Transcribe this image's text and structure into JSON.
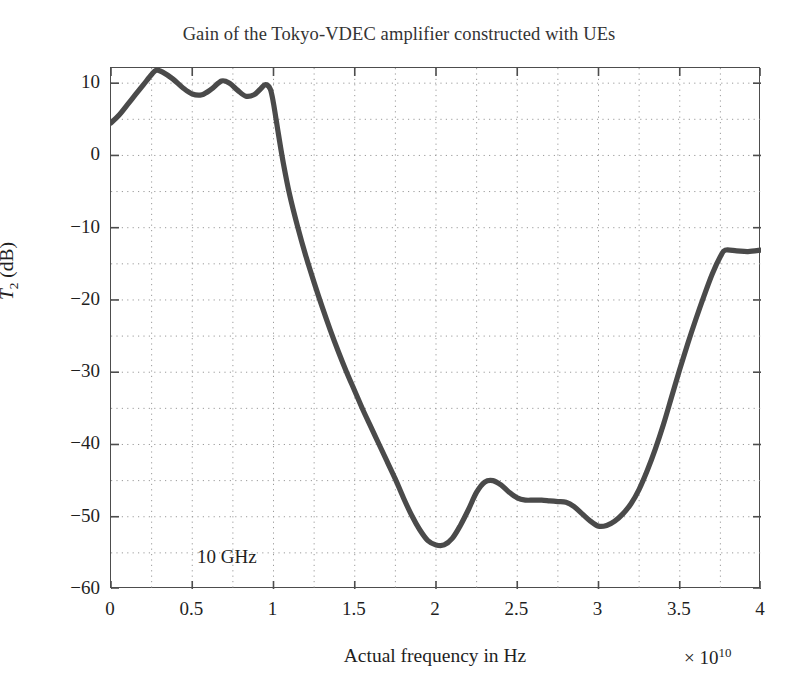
{
  "chart_data": {
    "type": "line",
    "title": "Gain of the Tokyo-VDEC amplifier constructed with UEs",
    "xlabel": "Actual frequency in Hz",
    "ylabel": "T_2 (dB)",
    "ylabel_base": "T",
    "ylabel_sub": "2",
    "ylabel_unit": " (dB)",
    "x_exponent_prefix": "× 10",
    "x_exponent_power": "10",
    "x_multiplier": 10000000000.0,
    "xlim": [
      0,
      4
    ],
    "ylim": [
      -60,
      12.1
    ],
    "xticks": [
      0,
      0.5,
      1,
      1.5,
      2,
      2.5,
      3,
      3.5,
      4
    ],
    "xtick_labels": [
      "0",
      "0.5",
      "1",
      "1.5",
      "2",
      "2.5",
      "3",
      "3.5",
      "4"
    ],
    "yticks": [
      10,
      0,
      -10,
      -20,
      -30,
      -40,
      -50,
      -60
    ],
    "ytick_labels": [
      "10",
      "0",
      "−10",
      "−20",
      "−30",
      "−40",
      "−50",
      "−60"
    ],
    "grid": true,
    "grid_style": "dotted",
    "grid_x_minor_step": 0.25,
    "grid_y_minor_step": 5,
    "legend": null,
    "annotations": [
      {
        "text": "10 GHz",
        "x": 0.53,
        "y": -55.0
      }
    ],
    "line_color": "#4a4a4a",
    "line_width": 5.2,
    "series": [
      {
        "name": "T2 gain",
        "x": [
          0.0,
          0.05,
          0.1,
          0.15,
          0.2,
          0.25,
          0.28,
          0.32,
          0.38,
          0.44,
          0.5,
          0.56,
          0.62,
          0.68,
          0.73,
          0.78,
          0.83,
          0.88,
          0.92,
          0.95,
          0.98,
          1.0,
          1.03,
          1.06,
          1.1,
          1.15,
          1.2,
          1.25,
          1.3,
          1.35,
          1.4,
          1.45,
          1.5,
          1.55,
          1.6,
          1.65,
          1.7,
          1.75,
          1.8,
          1.85,
          1.9,
          1.95,
          2.0,
          2.05,
          2.1,
          2.15,
          2.2,
          2.25,
          2.3,
          2.35,
          2.4,
          2.45,
          2.5,
          2.55,
          2.6,
          2.65,
          2.7,
          2.75,
          2.8,
          2.85,
          2.9,
          2.95,
          3.0,
          3.05,
          3.1,
          3.15,
          3.2,
          3.25,
          3.3,
          3.35,
          3.4,
          3.45,
          3.5,
          3.55,
          3.6,
          3.65,
          3.7,
          3.75,
          3.78,
          3.85,
          3.92,
          4.0
        ],
        "y": [
          4.5,
          5.6,
          7.0,
          8.4,
          9.8,
          11.2,
          11.8,
          11.5,
          10.6,
          9.4,
          8.5,
          8.4,
          9.2,
          10.3,
          10.0,
          9.0,
          8.2,
          8.4,
          9.2,
          9.8,
          9.2,
          7.2,
          3.0,
          -1.0,
          -5.5,
          -10.0,
          -14.0,
          -17.6,
          -21.0,
          -24.2,
          -27.2,
          -30.0,
          -32.6,
          -35.2,
          -37.6,
          -40.0,
          -42.4,
          -44.8,
          -47.4,
          -49.8,
          -51.8,
          -53.3,
          -53.9,
          -53.9,
          -53.0,
          -51.2,
          -49.0,
          -46.6,
          -45.2,
          -45.0,
          -45.6,
          -46.6,
          -47.4,
          -47.7,
          -47.7,
          -47.7,
          -47.8,
          -47.9,
          -48.0,
          -48.6,
          -49.6,
          -50.6,
          -51.3,
          -51.2,
          -50.6,
          -49.6,
          -48.2,
          -46.2,
          -43.6,
          -40.6,
          -37.2,
          -33.4,
          -29.6,
          -26.0,
          -22.6,
          -19.4,
          -16.4,
          -14.0,
          -13.1,
          -13.2,
          -13.3,
          -13.1
        ]
      }
    ]
  }
}
